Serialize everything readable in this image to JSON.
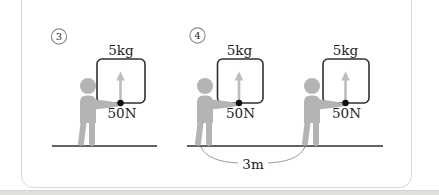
{
  "figure": {
    "diagram_left": {
      "number": "3",
      "mass_label": "5kg",
      "force_label": "50N"
    },
    "diagram_right": {
      "number": "4",
      "units": [
        {
          "mass_label": "5kg",
          "force_label": "50N"
        },
        {
          "mass_label": "5kg",
          "force_label": "50N"
        }
      ],
      "distance_label": "3m"
    },
    "colors": {
      "person": "#b4b4b4",
      "force_arrow": "#bdbdbd",
      "box_stroke": "#2f2f2f",
      "ground_line": "#636363",
      "text": "#1d1d1d",
      "panel_border": "#d8d8d8",
      "bottom_strip": "#e0e0db",
      "force_dot": "#111111",
      "distance_arc": "#9a9a9a"
    }
  }
}
